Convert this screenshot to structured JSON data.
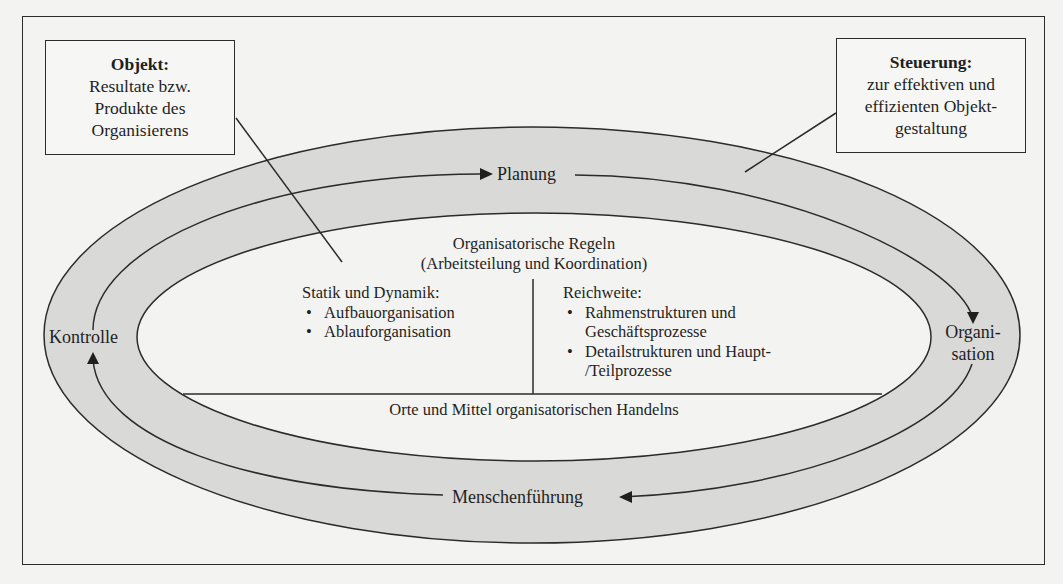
{
  "diagram": {
    "objekt_box": {
      "title": "Objekt:",
      "lines": [
        "Resultate bzw.",
        "Produkte des",
        "Organisierens"
      ]
    },
    "steuerung_box": {
      "title": "Steuerung:",
      "lines": [
        "zur effektiven und",
        "effizienten Objekt-",
        "gestaltung"
      ]
    },
    "cycle": {
      "planung": "Planung",
      "organisation_line1": "Organi-",
      "organisation_line2": "sation",
      "menschenfuehrung": "Menschenführung",
      "kontrolle": "Kontrolle"
    },
    "core": {
      "rules_line1": "Organisatorische Regeln",
      "rules_line2": "(Arbeitsteilung und Koordination)",
      "statik": {
        "heading": "Statik und Dynamik:",
        "items": [
          "Aufbauorganisation",
          "Ablauforganisation"
        ]
      },
      "reichweite": {
        "heading": "Reichweite:",
        "items": [
          [
            "Rahmenstrukturen und",
            "Geschäftsprozesse"
          ],
          [
            "Detailstrukturen und Haupt-",
            "/Teilprozesse"
          ]
        ]
      },
      "orte": "Orte und Mittel organisatorischen Handelns"
    },
    "colors": {
      "ring_fill": "#d9d9d7",
      "background": "#f3f3f1",
      "stroke": "#2b2b2b"
    }
  }
}
